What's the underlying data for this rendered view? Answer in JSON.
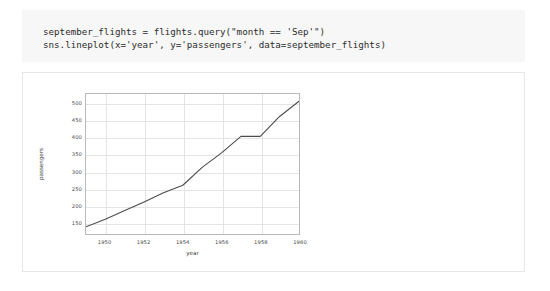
{
  "cell": {
    "code_lines": [
      "september_flights = flights.query(\"month == 'Sep'\")",
      "sns.lineplot(x='year', y='passengers', data=september_flights)"
    ]
  },
  "chart_data": {
    "type": "line",
    "title": "",
    "xlabel": "year",
    "ylabel": "passengers",
    "x": [
      1949,
      1950,
      1951,
      1952,
      1953,
      1954,
      1955,
      1956,
      1957,
      1958,
      1959,
      1960
    ],
    "values": [
      136,
      158,
      184,
      209,
      237,
      259,
      312,
      355,
      404,
      404,
      463,
      508
    ],
    "series": [
      {
        "name": "passengers",
        "values": [
          136,
          158,
          184,
          209,
          237,
          259,
          312,
          355,
          404,
          404,
          463,
          508
        ]
      }
    ],
    "xlim": [
      1949,
      1960
    ],
    "ylim": [
      114.4,
      529.6
    ],
    "xticks": [
      "1950",
      "1952",
      "1954",
      "1956",
      "1958",
      "1960"
    ],
    "xtick_values": [
      1950,
      1952,
      1954,
      1956,
      1958,
      1960
    ],
    "yticks": [
      "150",
      "200",
      "250",
      "300",
      "350",
      "400",
      "450",
      "500"
    ],
    "ytick_values": [
      150,
      200,
      250,
      300,
      350,
      400,
      450,
      500
    ],
    "grid": true,
    "legend": false,
    "line_color": "#4c4c4c",
    "grid_color": "#e4e4e4",
    "frame_color": "#b9b9b9",
    "background": "#ffffff"
  },
  "colors": {
    "code_background": "#f7f7f7",
    "code_text": "#2b2b2b",
    "output_background": "#ffffff",
    "output_border": "#e6e6e6",
    "page_background": "#ffffff"
  }
}
